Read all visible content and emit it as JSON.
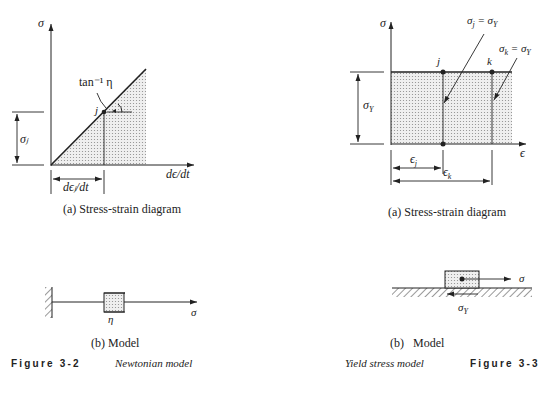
{
  "left_figure": {
    "diagram": {
      "y_axis_label": "σ",
      "x_axis_label": "dϵ/dt",
      "slope_label": "tan⁻¹ η",
      "point_label": "j",
      "stress_dim_label": "σⱼ",
      "rate_dim_label": "dϵⱼ/dt"
    },
    "caption_a": "(a) Stress-strain diagram",
    "model": {
      "dashpot_label": "η",
      "force_label": "σ"
    },
    "caption_b": "(b) Model",
    "figure_number": "Figure 3-2",
    "figure_title": "Newtonian model"
  },
  "right_figure": {
    "diagram": {
      "y_axis_label": "σ",
      "x_axis_label": "ϵ",
      "point_j_label": "j",
      "point_k_label": "k",
      "annot_j": "σⱼ = σ_Y",
      "annot_j_main": "σ",
      "annot_j_sub": "j",
      "annot_k_main": "σ",
      "annot_k_sub": "k",
      "annot_eq": " = σ",
      "annot_Y": "Y",
      "yield_dim_main": "σ",
      "yield_dim_sub": "Y",
      "strain_j_main": "ϵ",
      "strain_j_sub": "j",
      "strain_k_main": "ϵ",
      "strain_k_sub": "k"
    },
    "caption_a": "(a) Stress-strain diagram",
    "model": {
      "force_label": "σ",
      "friction_main": "σ",
      "friction_sub": "Y"
    },
    "caption_b": "(b)   Model",
    "figure_number": "Figure 3-3",
    "figure_title": "Yield stress model"
  },
  "colors": {
    "ink": "#222222",
    "shade_dot": "#9a9a9a",
    "shade_bg": "#e4e4e4"
  }
}
